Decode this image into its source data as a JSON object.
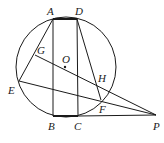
{
  "diagram": {
    "type": "geometry",
    "circle": {
      "center": "O",
      "cx": 66,
      "cy": 67,
      "r": 50
    },
    "points": {
      "A": {
        "x": 53,
        "y": 19,
        "label": "A",
        "lx": 47,
        "ly": 15
      },
      "D": {
        "x": 77,
        "y": 19,
        "label": "D",
        "lx": 75,
        "ly": 15
      },
      "B": {
        "x": 53,
        "y": 116,
        "label": "B",
        "lx": 48,
        "ly": 130
      },
      "C": {
        "x": 78,
        "y": 116,
        "label": "C",
        "lx": 74,
        "ly": 130
      },
      "E": {
        "x": 19,
        "y": 81,
        "label": "E",
        "lx": 8,
        "ly": 94
      },
      "G": {
        "x": 35,
        "y": 55,
        "label": "G",
        "lx": 37,
        "ly": 54
      },
      "O": {
        "x": 65,
        "y": 67,
        "label": "O",
        "lx": 62,
        "ly": 63
      },
      "H": {
        "x": 97,
        "y": 84,
        "label": "H",
        "lx": 98,
        "ly": 82
      },
      "F": {
        "x": 101,
        "y": 100,
        "label": "F",
        "lx": 99,
        "ly": 113
      },
      "P": {
        "x": 156,
        "y": 115,
        "label": "P",
        "lx": 153,
        "ly": 130
      }
    },
    "segments": [
      [
        "A",
        "B"
      ],
      [
        "D",
        "C"
      ],
      [
        "A",
        "D"
      ],
      [
        "B",
        "C"
      ],
      [
        "A",
        "E"
      ],
      [
        "E",
        "P"
      ],
      [
        "G",
        "P"
      ],
      [
        "D",
        "F"
      ],
      [
        "C",
        "P"
      ]
    ]
  }
}
